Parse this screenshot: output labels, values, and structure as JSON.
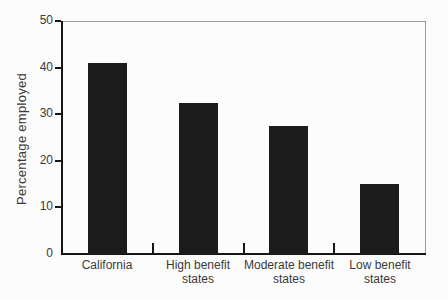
{
  "chart_data": {
    "type": "bar",
    "categories": [
      "California",
      "High benefit\nstates",
      "Moderate benefit\nstates",
      "Low benefit\nstates"
    ],
    "values": [
      41,
      32.5,
      27.5,
      15
    ],
    "title": "",
    "xlabel": "",
    "ylabel": "Percentage employed",
    "ylim": [
      0,
      50
    ],
    "yticks": [
      0,
      10,
      20,
      30,
      40,
      50
    ],
    "grid": false,
    "legend": false,
    "bar_color": "#1c1c1c"
  },
  "colors": {
    "background": "#fcfcfc",
    "bar": "#1c1c1c",
    "axis": "#161616",
    "frame": "#9b9b9b",
    "text": "#3a3a3a"
  }
}
